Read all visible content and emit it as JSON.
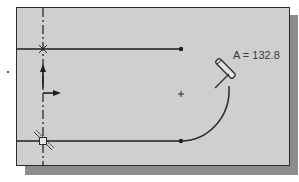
{
  "canvas": {
    "background_color": "#cfcfcf",
    "border_color": "#2b2b2b",
    "shadow_color": "#8c8c8c"
  },
  "sketch": {
    "angle_label": "A = 132.8",
    "entities": [
      {
        "type": "centerline",
        "orientation": "vertical"
      },
      {
        "type": "line",
        "name": "top-line"
      },
      {
        "type": "line",
        "name": "bottom-line"
      },
      {
        "type": "arc",
        "name": "tangent-arc"
      },
      {
        "type": "point",
        "name": "arc-center"
      }
    ],
    "cursor": "pencil-icon"
  }
}
